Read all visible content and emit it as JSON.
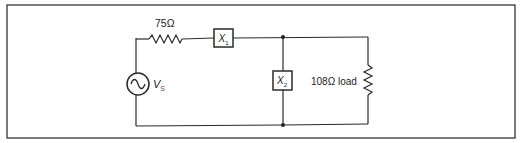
{
  "diagram": {
    "type": "circuit-schematic",
    "components": {
      "source": {
        "label_main": "V",
        "label_sub": "S",
        "symbol": "ac-voltage-source"
      },
      "series_resistor": {
        "label": "75Ω",
        "symbol": "resistor"
      },
      "x1": {
        "label_main": "X",
        "label_sub": "1",
        "symbol": "impedance-box"
      },
      "x2": {
        "label_main": "X",
        "label_sub": "2",
        "symbol": "impedance-box"
      },
      "load": {
        "label": "108Ω load",
        "symbol": "resistor"
      }
    },
    "colors": {
      "line": "#2a2a2a",
      "frame": "#333333",
      "background": "#ffffff"
    }
  }
}
